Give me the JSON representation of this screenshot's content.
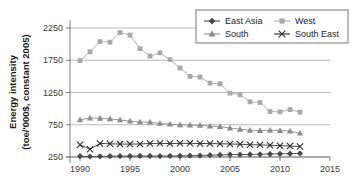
{
  "chart_data": {
    "type": "line",
    "title": "",
    "xlabel": "",
    "ylabel": "Energy intensity (toe/'000$, constant 2005)",
    "ylabel_line1": "Energy intensity",
    "ylabel_line2": "(toe/'000$, constant 2005)",
    "xlim": [
      1989,
      2015
    ],
    "ylim": [
      250,
      2250
    ],
    "xticks": [
      1990,
      1995,
      2000,
      2005,
      2010,
      2015
    ],
    "yticks": [
      250,
      750,
      1250,
      1750,
      2250
    ],
    "xtick_labels": [
      "1990",
      "1995",
      "2000",
      "2005",
      "2010",
      "2015"
    ],
    "ytick_labels": [
      "250",
      "750",
      "1250",
      "1750",
      "2250"
    ],
    "grid": "horizontal",
    "legend_position": "top-right",
    "x": [
      1990,
      1991,
      1992,
      1993,
      1994,
      1995,
      1996,
      1997,
      1998,
      1999,
      2000,
      2001,
      2002,
      2003,
      2004,
      2005,
      2006,
      2007,
      2008,
      2009,
      2010,
      2011,
      2012
    ],
    "series": [
      {
        "name": "East Asia",
        "marker": "diamond",
        "color": "#4a4a4a",
        "values": [
          262,
          258,
          260,
          262,
          264,
          265,
          266,
          266,
          265,
          266,
          268,
          270,
          272,
          278,
          282,
          288,
          288,
          290,
          292,
          296,
          300,
          302,
          306
        ]
      },
      {
        "name": "West",
        "marker": "square",
        "color": "#a8a8a8",
        "values": [
          1745,
          1880,
          2040,
          2030,
          2180,
          2140,
          1930,
          1815,
          1865,
          1760,
          1630,
          1500,
          1490,
          1395,
          1385,
          1240,
          1215,
          1105,
          1095,
          955,
          950,
          985,
          945
        ]
      },
      {
        "name": "South",
        "marker": "triangle",
        "color": "#8c8c8c",
        "values": [
          825,
          855,
          850,
          840,
          825,
          805,
          790,
          790,
          770,
          760,
          750,
          745,
          740,
          730,
          720,
          700,
          680,
          665,
          660,
          665,
          660,
          650,
          620
        ]
      },
      {
        "name": "South East",
        "marker": "cross",
        "color": "#2b2b2b",
        "values": [
          440,
          370,
          460,
          455,
          450,
          450,
          452,
          460,
          462,
          458,
          462,
          462,
          460,
          458,
          455,
          452,
          448,
          440,
          438,
          432,
          425,
          420,
          412
        ]
      }
    ]
  },
  "legend": {
    "entries": [
      {
        "label": "East Asia"
      },
      {
        "label": "West"
      },
      {
        "label": "South"
      },
      {
        "label": "South East"
      }
    ]
  },
  "colors": {
    "east_asia": "#4a4a4a",
    "west": "#a8a8a8",
    "south": "#8c8c8c",
    "south_east": "#2b2b2b",
    "grid": "#9a9a9a",
    "axis": "#6e6e6e",
    "text": "#1a1a1a"
  }
}
